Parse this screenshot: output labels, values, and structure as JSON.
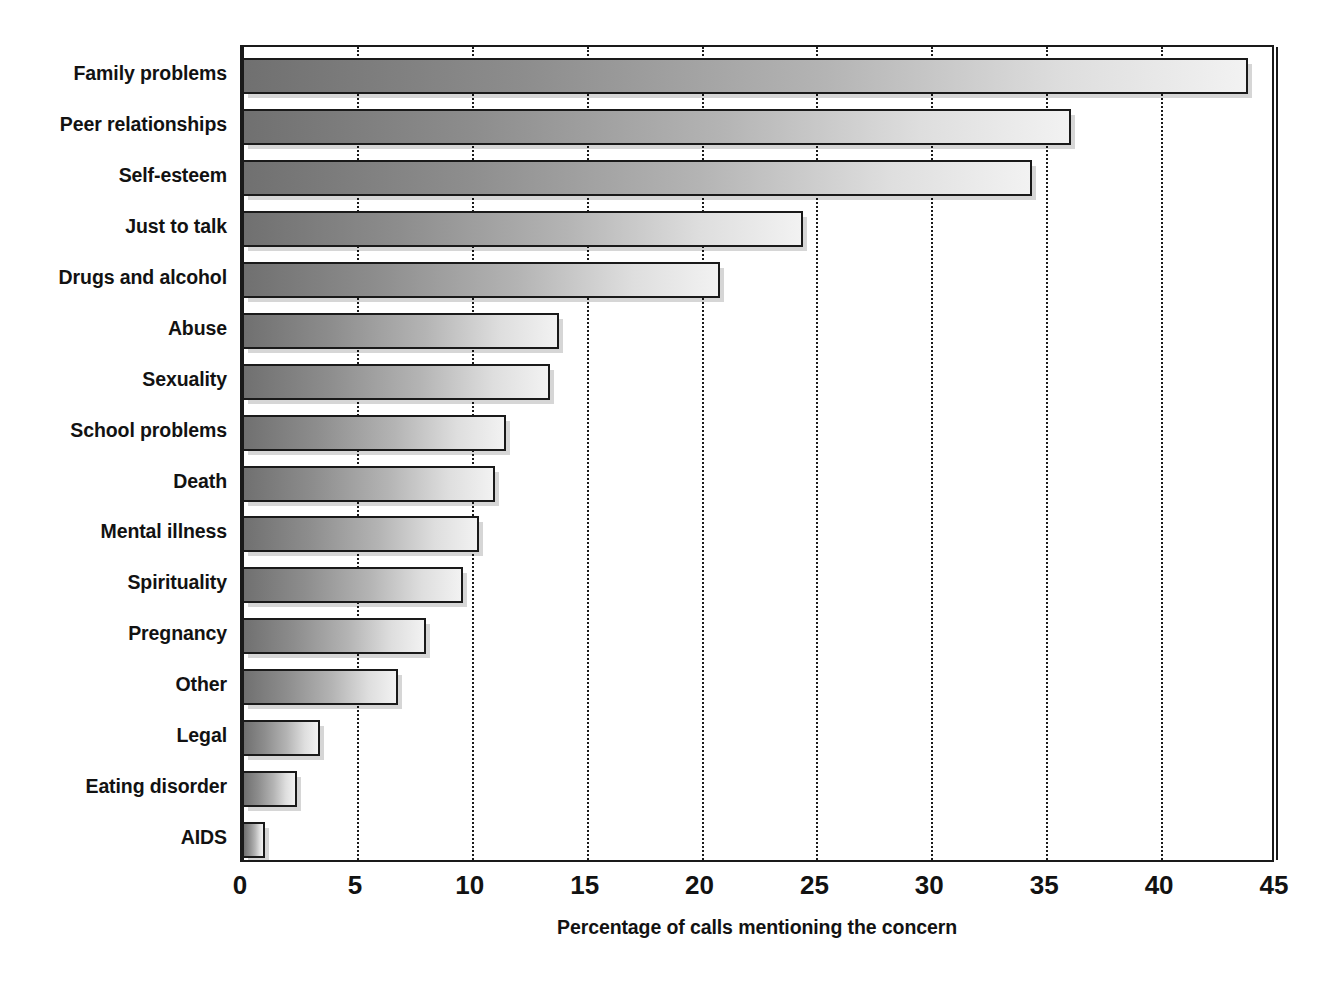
{
  "chart_data": {
    "type": "bar",
    "orientation": "horizontal",
    "title": "",
    "xlabel": "Percentage of calls mentioning the concern",
    "ylabel": "",
    "xlim": [
      0,
      45
    ],
    "ylim": null,
    "xticks": [
      0,
      5,
      10,
      15,
      20,
      25,
      30,
      35,
      40,
      45
    ],
    "xtick_labels": [
      "0",
      "5",
      "10",
      "15",
      "20",
      "25",
      "30",
      "35",
      "40",
      "45"
    ],
    "grid": "vertical-dotted",
    "legend": null,
    "categories": [
      "Family problems",
      "Peer relationships",
      "Self-esteem",
      "Just to talk",
      "Drugs and alcohol",
      "Abuse",
      "Sexuality",
      "School problems",
      "Death",
      "Mental illness",
      "Spirituality",
      "Pregnancy",
      "Other",
      "Legal",
      "Eating disorder",
      "AIDS"
    ],
    "values": [
      43.8,
      36.1,
      34.4,
      24.4,
      20.8,
      13.8,
      13.4,
      11.5,
      11.0,
      10.3,
      9.6,
      8.0,
      6.8,
      3.4,
      2.4,
      1.0
    ],
    "bar_fill": "linear-gradient-gray-dark-to-light",
    "bar_edge_color": "#1a1a1a",
    "background_color": "#ffffff"
  }
}
